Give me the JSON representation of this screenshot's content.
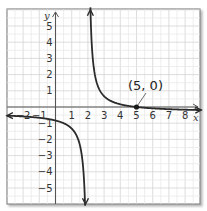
{
  "chart_data": {
    "type": "line",
    "title": "",
    "xlabel": "x",
    "ylabel": "y",
    "xlim": [
      -3,
      9
    ],
    "ylim": [
      -6,
      6
    ],
    "grid": true,
    "grid_minor": 0.5,
    "x_ticks": [
      "-2",
      "-1",
      "1",
      "2",
      "3",
      "4",
      "5",
      "6",
      "7",
      "8"
    ],
    "y_ticks": [
      "5",
      "4",
      "3",
      "2",
      "1",
      "-1",
      "-2",
      "-3",
      "-4",
      "-5"
    ],
    "vertical_asymptote": 2,
    "horizontal_asymptote": 0,
    "series": [
      {
        "name": "left-branch",
        "description": "curve for x < 2, approaching -infinity near x=2 and y=0 as x->-infinity",
        "points": [
          [
            -3,
            -0.8
          ],
          [
            -2,
            -1
          ],
          [
            -1,
            -1.2
          ],
          [
            0,
            -1.6
          ],
          [
            1,
            -2.5
          ],
          [
            1.5,
            -4
          ],
          [
            1.75,
            -6
          ]
        ]
      },
      {
        "name": "right-branch",
        "description": "curve for x > 2, approaching +infinity near x=2, passing through (5,0)",
        "points": [
          [
            2.1,
            6
          ],
          [
            2.5,
            3
          ],
          [
            3,
            1.5
          ],
          [
            4,
            0.5
          ],
          [
            5,
            0
          ],
          [
            6,
            -0.2
          ],
          [
            7,
            -0.3
          ],
          [
            8,
            -0.4
          ],
          [
            9,
            -0.45
          ]
        ]
      }
    ],
    "annotations": [
      {
        "text": "(5, 0)",
        "x": 5,
        "y": 0,
        "marker": "point"
      }
    ]
  },
  "labels": {
    "x_axis": "x",
    "y_axis": "y",
    "point_label": "(5, 0)"
  },
  "colors": {
    "grid": "#d9d9d9",
    "axis": "#555555",
    "curve": "#2b2b2b",
    "frame": "#888888"
  }
}
